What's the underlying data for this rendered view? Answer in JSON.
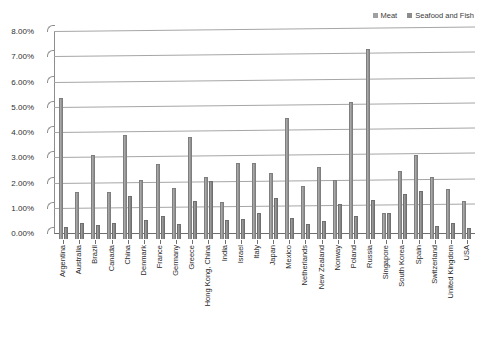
{
  "chart_data": {
    "type": "bar",
    "title": "",
    "xlabel": "",
    "ylabel": "",
    "ylim": [
      0,
      8
    ],
    "ytick_labels": [
      "0.00%",
      "1.00%",
      "2.00%",
      "3.00%",
      "4.00%",
      "5.00%",
      "6.00%",
      "7.00%",
      "8.00%"
    ],
    "ytick_values": [
      0,
      1,
      2,
      3,
      4,
      5,
      6,
      7,
      8
    ],
    "grid": true,
    "legend_position": "top-right",
    "categories": [
      "Argentina",
      "Australia",
      "Brazil",
      "Canada",
      "China",
      "Denmark",
      "France",
      "Germany",
      "Greece",
      "Hong Kong, China",
      "India",
      "Israel",
      "Italy",
      "Japan",
      "Mexico",
      "Netherlands",
      "New Zealand",
      "Norway",
      "Poland",
      "Russia",
      "Singapore",
      "South Korea",
      "Spain",
      "Switzerland",
      "United Kingdom",
      "USA"
    ],
    "series": [
      {
        "name": "Meat",
        "color": "#9e9e9e",
        "values": [
          5.6,
          1.85,
          3.32,
          1.85,
          4.1,
          2.35,
          2.98,
          2.02,
          4.05,
          2.45,
          1.45,
          3.02,
          3.02,
          2.62,
          4.78,
          2.08,
          2.85,
          2.35,
          5.42,
          7.52,
          1.05,
          2.68,
          3.32,
          2.45,
          2.0,
          1.52
        ]
      },
      {
        "name": "Seafood and Fish",
        "color": "#8c8c8c",
        "values": [
          0.48,
          0.65,
          0.55,
          0.65,
          1.72,
          0.75,
          0.9,
          0.6,
          1.5,
          2.3,
          0.75,
          0.78,
          1.02,
          1.62,
          0.82,
          0.6,
          0.72,
          1.4,
          0.92,
          1.55,
          1.05,
          1.8,
          1.9,
          0.5,
          0.62,
          0.42
        ]
      }
    ]
  },
  "legend": {
    "entries": [
      {
        "label": "Meat"
      },
      {
        "label": "Seafood and Fish"
      }
    ]
  },
  "caption": ""
}
